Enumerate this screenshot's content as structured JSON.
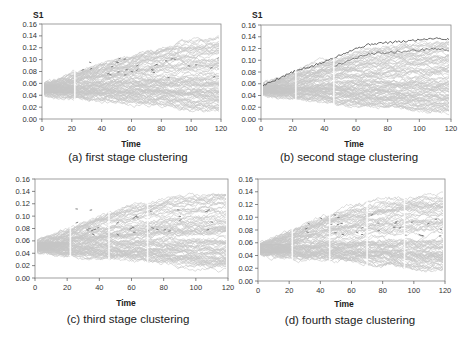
{
  "figure": {
    "panels": [
      {
        "id": "a",
        "caption": "(a) first stage clustering",
        "ylabel": "S1",
        "xlabel": "Time"
      },
      {
        "id": "b",
        "caption": "(b) second stage clustering",
        "ylabel": "S1",
        "xlabel": "Time"
      },
      {
        "id": "c",
        "caption": "(c) third stage clustering",
        "ylabel": "",
        "xlabel": "Time"
      },
      {
        "id": "d",
        "caption": "(d) fourth stage clustering",
        "ylabel": "",
        "xlabel": "Time"
      }
    ]
  },
  "chart_data": [
    {
      "type": "line",
      "title": "(a) first stage clustering",
      "xlabel": "Time",
      "ylabel": "S1",
      "xlim": [
        0,
        120
      ],
      "ylim": [
        0,
        0.16
      ],
      "xticks": [
        0,
        20,
        40,
        60,
        80,
        100,
        120
      ],
      "yticks": [
        0.0,
        0.02,
        0.04,
        0.06,
        0.08,
        0.1,
        0.12,
        0.14,
        0.16
      ],
      "grid": false,
      "series_description": "~200 simulated paths (light gray) starting near 0.05; fan widens over time to ~0.01–0.14 at t=120; a few dark highlighted paths near 0.06–0.10",
      "stage_breaks": [
        22
      ],
      "envelope": {
        "x": [
          0,
          20,
          40,
          60,
          80,
          100,
          120
        ],
        "upper": [
          0.058,
          0.075,
          0.095,
          0.11,
          0.125,
          0.135,
          0.14
        ],
        "lower": [
          0.042,
          0.035,
          0.03,
          0.025,
          0.02,
          0.012,
          0.008
        ],
        "median": [
          0.05,
          0.055,
          0.06,
          0.062,
          0.064,
          0.065,
          0.066
        ]
      }
    },
    {
      "type": "line",
      "title": "(b) second stage clustering",
      "xlabel": "Time",
      "ylabel": "S1",
      "xlim": [
        0,
        120
      ],
      "ylim": [
        0,
        0.16
      ],
      "xticks": [
        0,
        20,
        40,
        60,
        80,
        100,
        120
      ],
      "yticks": [
        0.0,
        0.02,
        0.04,
        0.06,
        0.08,
        0.1,
        0.12,
        0.14,
        0.16
      ],
      "grid": false,
      "series_description": "~200 simulated paths (light gray); dark highlighted paths forming the upper cluster rising from 0.07 to ~0.135 at t=120",
      "stage_breaks": [
        22,
        46
      ],
      "highlight": {
        "x": [
          0,
          10,
          20,
          30,
          40,
          46,
          60,
          70,
          80,
          90,
          100,
          110,
          120
        ],
        "y": [
          0.055,
          0.068,
          0.08,
          0.088,
          0.097,
          0.105,
          0.12,
          0.128,
          0.13,
          0.132,
          0.135,
          0.138,
          0.135
        ]
      },
      "envelope": {
        "x": [
          0,
          20,
          40,
          60,
          80,
          100,
          120
        ],
        "upper": [
          0.058,
          0.078,
          0.1,
          0.115,
          0.125,
          0.13,
          0.135
        ],
        "lower": [
          0.042,
          0.035,
          0.03,
          0.022,
          0.018,
          0.012,
          0.008
        ],
        "median": [
          0.05,
          0.055,
          0.06,
          0.062,
          0.064,
          0.065,
          0.066
        ]
      }
    },
    {
      "type": "line",
      "title": "(c) third stage clustering",
      "xlabel": "Time",
      "ylabel": "",
      "xlim": [
        0,
        120
      ],
      "ylim": [
        0,
        0.16
      ],
      "xticks": [
        0,
        20,
        40,
        60,
        80,
        100,
        120
      ],
      "yticks": [
        0.0,
        0.02,
        0.04,
        0.06,
        0.08,
        0.1,
        0.12,
        0.14,
        0.16
      ],
      "grid": false,
      "series_description": "~200 simulated paths (light gray); dark highlighted segments near 0.10–0.11 between t=50–120",
      "stage_breaks": [
        22,
        46,
        70
      ],
      "envelope": {
        "x": [
          0,
          20,
          40,
          60,
          80,
          100,
          120
        ],
        "upper": [
          0.058,
          0.078,
          0.1,
          0.118,
          0.128,
          0.135,
          0.138
        ],
        "lower": [
          0.042,
          0.035,
          0.03,
          0.025,
          0.02,
          0.012,
          0.008
        ],
        "median": [
          0.05,
          0.055,
          0.06,
          0.062,
          0.064,
          0.065,
          0.066
        ]
      }
    },
    {
      "type": "line",
      "title": "(d) fourth stage clustering",
      "xlabel": "Time",
      "ylabel": "",
      "xlim": [
        0,
        120
      ],
      "ylim": [
        0,
        0.16
      ],
      "xticks": [
        0,
        20,
        40,
        60,
        80,
        100,
        120
      ],
      "yticks": [
        0.0,
        0.02,
        0.04,
        0.06,
        0.08,
        0.1,
        0.12,
        0.14,
        0.16
      ],
      "grid": false,
      "series_description": "~200 simulated paths (light gray); faint dark points scattered near 0.08–0.09",
      "stage_breaks": [
        22,
        46,
        70,
        94
      ],
      "envelope": {
        "x": [
          0,
          20,
          40,
          60,
          80,
          100,
          120
        ],
        "upper": [
          0.058,
          0.078,
          0.1,
          0.118,
          0.128,
          0.135,
          0.138
        ],
        "lower": [
          0.042,
          0.035,
          0.03,
          0.025,
          0.02,
          0.012,
          0.008
        ],
        "median": [
          0.05,
          0.055,
          0.06,
          0.062,
          0.064,
          0.065,
          0.066
        ]
      }
    }
  ]
}
